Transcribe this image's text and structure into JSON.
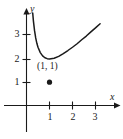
{
  "figure": {
    "name": "coordinate-plane-curve-with-labeled-minimum",
    "background_color": "#ffffff",
    "ink_color": "#1a1a1a"
  },
  "axes": {
    "x_label": "x",
    "y_label": "y",
    "x_ticks": [
      "1",
      "2",
      "3"
    ],
    "y_ticks": [
      "1",
      "2",
      "3"
    ]
  },
  "annotations": {
    "point_label": "(1, 1)"
  },
  "chart_data": {
    "type": "line",
    "title": "",
    "xlabel": "x",
    "ylabel": "y",
    "xlim": [
      0,
      3.6
    ],
    "ylim": [
      0,
      3.6
    ],
    "grid": false,
    "legend": "none",
    "x_tick_values": [
      1,
      2,
      3
    ],
    "y_tick_values": [
      1,
      2,
      3
    ],
    "annotations": [
      {
        "text": "(1, 1)",
        "x": 1,
        "y": 1,
        "marker": "filled-dot"
      }
    ],
    "series": [
      {
        "name": "curve",
        "x": [
          0.27,
          0.3,
          0.35,
          0.4,
          0.45,
          0.5,
          0.6,
          0.7,
          0.8,
          0.9,
          1.0,
          1.2,
          1.4,
          1.6,
          1.8,
          2.0,
          2.2,
          2.4,
          2.6,
          2.8,
          3.0,
          3.2
        ],
        "y": [
          3.97,
          3.63,
          3.21,
          2.9,
          2.67,
          2.5,
          2.27,
          2.13,
          2.05,
          2.01,
          2.0,
          2.03,
          2.11,
          2.23,
          2.36,
          2.5,
          2.65,
          2.82,
          2.98,
          3.16,
          3.33,
          3.51
        ]
      }
    ]
  }
}
